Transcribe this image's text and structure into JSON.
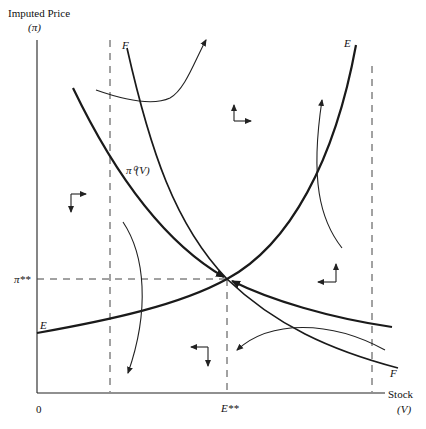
{
  "diagram": {
    "y_axis_label": "Imputed Price",
    "y_axis_symbol": "(π)",
    "x_axis_label": "Stock",
    "x_axis_symbol": "(V)",
    "origin_label": "0",
    "equilibrium_stock_label": "E**",
    "equilibrium_price_label": "π**",
    "curves": {
      "E": {
        "label_start": "E",
        "label_end": "E",
        "description": "upward sloping E-E locus"
      },
      "F": {
        "label_start": "F",
        "label_end": "F",
        "description": "downward sloping F-F locus"
      },
      "pi0": {
        "label": "π⁰(V)",
        "description": "saddle path converging to equilibrium"
      }
    },
    "direction_arrows": [
      {
        "region": "upper-left",
        "horizontal": "right",
        "vertical": "down"
      },
      {
        "region": "upper-right",
        "horizontal": "right",
        "vertical": "up"
      },
      {
        "region": "lower-left",
        "horizontal": "left",
        "vertical": "down"
      },
      {
        "region": "lower-right",
        "horizontal": "left",
        "vertical": "up"
      }
    ]
  }
}
